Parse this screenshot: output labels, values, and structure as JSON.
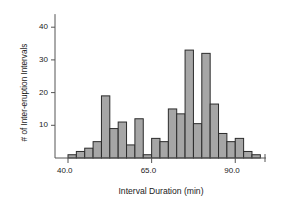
{
  "chart_data": {
    "type": "bar",
    "title": "",
    "subtitle": "",
    "xlabel": "Interval Duration (min)",
    "ylabel": "# of Inter-eruption Intervals",
    "bin_width": 2.5,
    "bin_starts": [
      40.0,
      42.5,
      45.0,
      47.5,
      50.0,
      52.5,
      55.0,
      57.5,
      60.0,
      62.5,
      65.0,
      67.5,
      70.0,
      72.5,
      75.0,
      77.5,
      80.0,
      82.5,
      85.0,
      87.5,
      90.0,
      92.5,
      95.0
    ],
    "categories": [
      "40.0-42.5",
      "42.5-45.0",
      "45.0-47.5",
      "47.5-50.0",
      "50.0-52.5",
      "52.5-55.0",
      "55.0-57.5",
      "57.5-60.0",
      "60.0-62.5",
      "62.5-65.0",
      "65.0-67.5",
      "67.5-70.0",
      "70.0-72.5",
      "72.5-75.0",
      "75.0-77.5",
      "77.5-80.0",
      "80.0-82.5",
      "82.5-85.0",
      "85.0-87.5",
      "87.5-90.0",
      "90.0-92.5",
      "92.5-95.0",
      "95.0-97.5"
    ],
    "values": [
      1,
      2,
      3,
      5,
      19,
      9,
      11,
      4,
      12,
      1,
      6,
      5,
      15,
      13.5,
      33,
      10.5,
      32,
      16.5,
      7.5,
      5,
      6,
      2,
      1
    ],
    "xlim": [
      37.5,
      99.0
    ],
    "ylim": [
      0,
      44
    ],
    "xticks": [
      40.0,
      65.0,
      90.0
    ],
    "xtick_labels": [
      "40.0",
      "65.0",
      "90.0"
    ],
    "yticks": [
      10,
      20,
      30,
      40
    ],
    "ytick_labels": [
      "10",
      "20",
      "30",
      "40"
    ],
    "grid": false,
    "legend": null,
    "bar_fill_color": "#a6a6a6",
    "bar_edge_color": "#2b2b2b",
    "axis_color": "#555555",
    "text_color": "#1a1a1a"
  }
}
